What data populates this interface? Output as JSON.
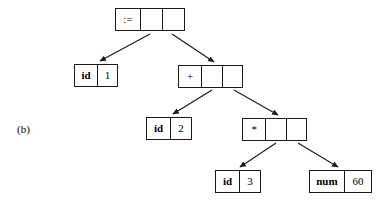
{
  "figure": {
    "caption": "(b)",
    "type": "syntax-tree-with-pointer-nodes",
    "background_color": "#ffffff",
    "line_color": "#1a1a1a"
  },
  "nodes": [
    {
      "id": "assign",
      "name": "assignment-node",
      "cells": [
        {
          "text": ":=",
          "kind": "op"
        },
        {
          "text": "",
          "kind": "ptr"
        },
        {
          "text": "",
          "kind": "ptr"
        }
      ]
    },
    {
      "id": "id1",
      "name": "id-1-node",
      "cells": [
        {
          "text": "id",
          "kind": "label"
        },
        {
          "text": "1",
          "kind": "value"
        }
      ]
    },
    {
      "id": "plus",
      "name": "plus-node",
      "cells": [
        {
          "text": "+",
          "kind": "op"
        },
        {
          "text": "",
          "kind": "ptr"
        },
        {
          "text": "",
          "kind": "ptr"
        }
      ]
    },
    {
      "id": "id2",
      "name": "id-2-node",
      "cells": [
        {
          "text": "id",
          "kind": "label"
        },
        {
          "text": "2",
          "kind": "value"
        }
      ]
    },
    {
      "id": "star",
      "name": "multiply-node",
      "cells": [
        {
          "text": "*",
          "kind": "op"
        },
        {
          "text": "",
          "kind": "ptr"
        },
        {
          "text": "",
          "kind": "ptr"
        }
      ]
    },
    {
      "id": "id3",
      "name": "id-3-node",
      "cells": [
        {
          "text": "id",
          "kind": "label"
        },
        {
          "text": "3",
          "kind": "value"
        }
      ]
    },
    {
      "id": "num60",
      "name": "num-60-node",
      "cells": [
        {
          "text": "num",
          "kind": "label"
        },
        {
          "text": "60",
          "kind": "value"
        }
      ]
    }
  ],
  "edges": [
    {
      "from": "assign",
      "from_cell": 1,
      "to": "id1",
      "name": "edge-assign-to-id1"
    },
    {
      "from": "assign",
      "from_cell": 2,
      "to": "plus",
      "name": "edge-assign-to-plus"
    },
    {
      "from": "plus",
      "from_cell": 1,
      "to": "id2",
      "name": "edge-plus-to-id2"
    },
    {
      "from": "plus",
      "from_cell": 2,
      "to": "star",
      "name": "edge-plus-to-star"
    },
    {
      "from": "star",
      "from_cell": 1,
      "to": "id3",
      "name": "edge-star-to-id3"
    },
    {
      "from": "star",
      "from_cell": 2,
      "to": "num60",
      "name": "edge-star-to-num60"
    }
  ]
}
